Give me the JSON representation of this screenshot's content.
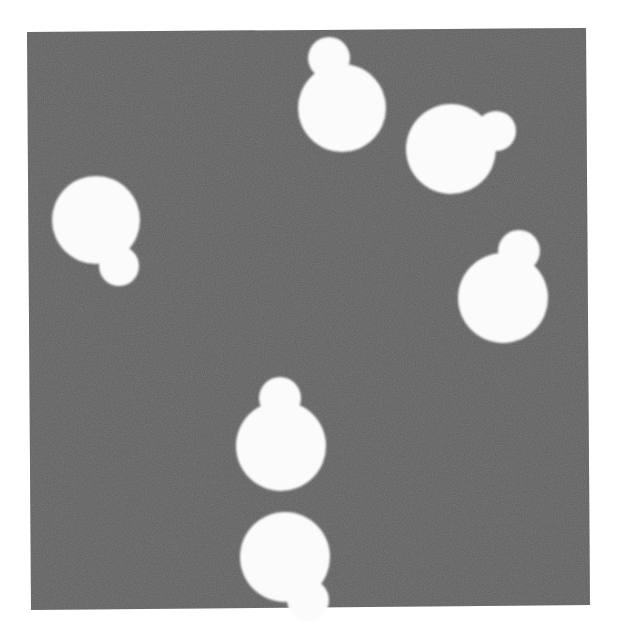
{
  "image": {
    "width": 618,
    "height": 639,
    "page_background": "#ffffff",
    "description": "Grayscale microscopy-style image of budding yeast cells (white mother cells with small buds) on a dark gray field"
  },
  "field": {
    "color": "#5e5e5e",
    "noise_color": "#6a6a6a",
    "corners": [
      [
        27,
        32
      ],
      [
        586,
        28
      ],
      [
        590,
        605
      ],
      [
        31,
        610
      ]
    ]
  },
  "cells": {
    "color": "#fbfbfb",
    "count": 6,
    "items": [
      {
        "id": "cell-top-center",
        "mother": {
          "cx": 342,
          "cy": 108,
          "r": 44
        },
        "bud": {
          "cx": 329,
          "cy": 58,
          "r": 21
        }
      },
      {
        "id": "cell-upper-right",
        "mother": {
          "cx": 451,
          "cy": 149,
          "r": 45
        },
        "bud": {
          "cx": 496,
          "cy": 131,
          "r": 20
        }
      },
      {
        "id": "cell-left",
        "mother": {
          "cx": 96,
          "cy": 220,
          "r": 44
        },
        "bud": {
          "cx": 119,
          "cy": 266,
          "r": 20
        }
      },
      {
        "id": "cell-right-middle",
        "mother": {
          "cx": 503,
          "cy": 298,
          "r": 45
        },
        "bud": {
          "cx": 519,
          "cy": 251,
          "r": 21
        }
      },
      {
        "id": "cell-bottom-middle",
        "mother": {
          "cx": 281,
          "cy": 446,
          "r": 45
        },
        "bud": {
          "cx": 280,
          "cy": 398,
          "r": 21
        }
      },
      {
        "id": "cell-bottom-edge",
        "mother": {
          "cx": 285,
          "cy": 557,
          "r": 45
        },
        "bud": {
          "cx": 308,
          "cy": 600,
          "r": 21
        }
      }
    ]
  }
}
